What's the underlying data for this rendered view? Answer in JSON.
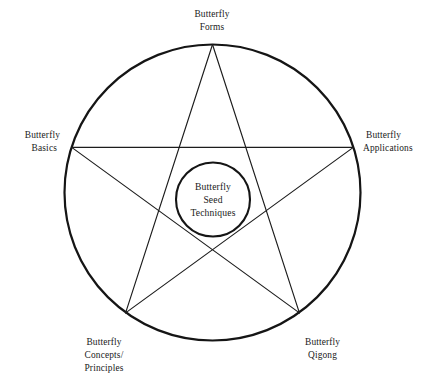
{
  "figure": {
    "type": "pentagram-diagram",
    "background_color": "#ffffff",
    "line_color": "#1a1a1a",
    "center": {
      "lines": [
        "Butterfly",
        "Seed",
        "Techniques"
      ],
      "line1": "Butterfly",
      "line2": "Seed",
      "line3": "Techniques"
    },
    "nodes": [
      {
        "id": "forms",
        "position": "top",
        "lines": [
          "Butterfly",
          "Forms"
        ],
        "line1": "Butterfly",
        "line2": "Forms"
      },
      {
        "id": "applications",
        "position": "right",
        "lines": [
          "Butterfly",
          "Applications"
        ],
        "line1": "Butterfly",
        "line2": "Applications"
      },
      {
        "id": "qigong",
        "position": "bottom-right",
        "lines": [
          "Butterfly",
          "Qigong"
        ],
        "line1": "Butterfly",
        "line2": "Qigong"
      },
      {
        "id": "concepts-principles",
        "position": "bottom-left",
        "lines": [
          "Butterfly",
          "Concepts/",
          "Principles"
        ],
        "line1": "Butterfly",
        "line2": "Concepts/",
        "line3": "Principles"
      },
      {
        "id": "basics",
        "position": "left",
        "lines": [
          "Butterfly",
          "Basics"
        ],
        "line1": "Butterfly",
        "line2": "Basics"
      }
    ]
  }
}
